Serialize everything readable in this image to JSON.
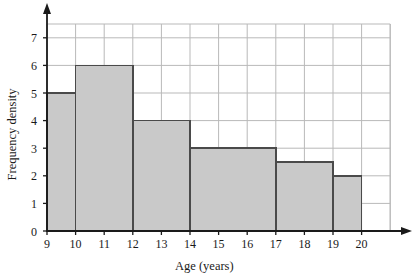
{
  "chart_data": {
    "type": "bar",
    "title": "",
    "subtitle": "",
    "xlabel": "Age (years)",
    "ylabel": "Frequency density",
    "xlim": [
      9,
      21
    ],
    "ylim": [
      0,
      7.5
    ],
    "grid": true,
    "legend": null,
    "x_tick_labels": [
      "9",
      "10",
      "11",
      "12",
      "13",
      "14",
      "15",
      "16",
      "17",
      "18",
      "19",
      "20"
    ],
    "x_tick_values": [
      9,
      10,
      11,
      12,
      13,
      14,
      15,
      16,
      17,
      18,
      19,
      20
    ],
    "y_tick_labels": [
      "0",
      "1",
      "2",
      "3",
      "4",
      "5",
      "6",
      "7"
    ],
    "y_tick_values": [
      0,
      1,
      2,
      3,
      4,
      5,
      6,
      7
    ],
    "bins": [
      {
        "label": "9-10",
        "start": 9,
        "end": 10,
        "width": 1,
        "value": 5,
        "frequency": 5
      },
      {
        "label": "10-12",
        "start": 10,
        "end": 12,
        "width": 2,
        "value": 6,
        "frequency": 12
      },
      {
        "label": "12-14",
        "start": 12,
        "end": 14,
        "width": 2,
        "value": 4,
        "frequency": 8
      },
      {
        "label": "14-17",
        "start": 14,
        "end": 17,
        "width": 3,
        "value": 3,
        "frequency": 9
      },
      {
        "label": "17-19",
        "start": 17,
        "end": 19,
        "width": 2,
        "value": 2.5,
        "frequency": 5
      },
      {
        "label": "19-20",
        "start": 19,
        "end": 20,
        "width": 1,
        "value": 2,
        "frequency": 2
      }
    ],
    "categories": [
      "9-10",
      "10-12",
      "12-14",
      "14-17",
      "17-19",
      "19-20"
    ],
    "values": [
      5,
      6,
      4,
      3,
      2.5,
      2
    ],
    "colors": {
      "bar_fill": "#c9c9c9",
      "bar_stroke": "#4a4a4a",
      "grid": "#b9b9b9",
      "axis": "#1a1a1a",
      "background": "#ffffff"
    }
  }
}
